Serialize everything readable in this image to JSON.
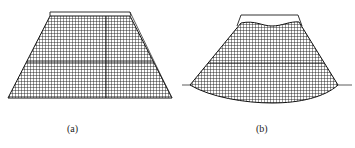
{
  "figure": {
    "panels": [
      {
        "id": "a",
        "caption": "(a)",
        "description": "Trapezoidal mesh with rectangular outline at top",
        "shape": "trapezoid"
      },
      {
        "id": "b",
        "caption": "(b)",
        "description": "Deformed mesh with curved bottom and wavy top surface, resting on a ground line",
        "shape": "deformed-trapezoid"
      }
    ],
    "colors": {
      "mesh_line": "#1a1a1a",
      "outline": "#333333",
      "background": "#ffffff"
    }
  }
}
